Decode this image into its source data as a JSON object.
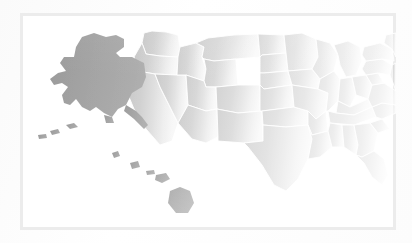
{
  "map": {
    "title": "United States Choropleth Map",
    "projection": "albers-usa",
    "frame": {
      "visible": true,
      "border_color": "#ececec",
      "border_width": 3,
      "x": 20,
      "y": 13,
      "width": 376,
      "height": 217
    },
    "background_color": "#ffffff",
    "state_border_color": "#ffffff",
    "state_border_width": 0.9,
    "fill_mainland": "#c9c9c9",
    "fill_highlight": "#9a9a9a",
    "highlighted_regions": [
      "Alaska",
      "Hawaii"
    ],
    "legend": {
      "visible": false
    },
    "labels": {
      "visible": false
    }
  },
  "chart_data": {
    "type": "map",
    "subtitle": "",
    "xlabel": "",
    "ylabel": "",
    "legend_position": "none",
    "grid": false,
    "colors": {
      "base_fill": "#c9c9c9",
      "highlight_fill": "#9a9a9a",
      "border": "#ffffff",
      "frame": "#ececec",
      "background": "#ffffff"
    },
    "categories": [
      "Alaska",
      "Hawaii",
      "Washington",
      "Oregon",
      "California",
      "Nevada",
      "Idaho",
      "Montana",
      "Wyoming",
      "Utah",
      "Arizona",
      "Colorado",
      "New Mexico",
      "North Dakota",
      "South Dakota",
      "Nebraska",
      "Kansas",
      "Oklahoma",
      "Texas",
      "Minnesota",
      "Iowa",
      "Missouri",
      "Arkansas",
      "Louisiana",
      "Wisconsin",
      "Illinois",
      "Michigan",
      "Indiana",
      "Ohio",
      "Kentucky",
      "Tennessee",
      "Mississippi",
      "Alabama",
      "Georgia",
      "Florida",
      "South Carolina",
      "North Carolina",
      "Virginia",
      "West Virginia",
      "Pennsylvania",
      "New York",
      "Maine",
      "Vermont",
      "New Hampshire",
      "Massachusetts",
      "Rhode Island",
      "Connecticut",
      "New Jersey",
      "Delaware",
      "Maryland"
    ],
    "values": [
      1,
      1,
      0,
      0,
      0,
      0,
      0,
      0,
      0,
      0,
      0,
      0,
      0,
      0,
      0,
      0,
      0,
      0,
      0,
      0,
      0,
      0,
      0,
      0,
      0,
      0,
      0,
      0,
      0,
      0,
      0,
      0,
      0,
      0,
      0,
      0,
      0,
      0,
      0,
      0,
      0,
      0,
      0,
      0,
      0,
      0,
      0,
      0,
      0,
      0
    ],
    "value_labels": {
      "0": "base",
      "1": "highlighted"
    }
  }
}
